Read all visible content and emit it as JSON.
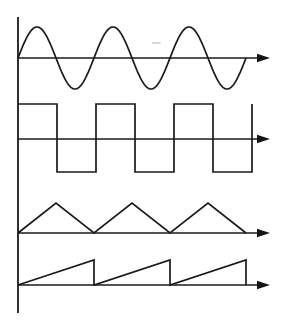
{
  "figure": {
    "background_color": "#ffffff",
    "line_color": "#1a1a1a",
    "width": 284,
    "height": 329
  },
  "vertical_axis": {
    "name": "shared-vertical-axis",
    "x": 18,
    "y_top": 17,
    "y_bottom": 313
  },
  "waveforms": [
    {
      "id": "sine",
      "label": "Sine wave",
      "shape": "sine",
      "axis_y": 58,
      "amplitude": 31,
      "period": 76,
      "x_start": 18,
      "x_end": 248,
      "cycles": 3,
      "phase": "rising-from-zero",
      "arrow_tip_x": 270
    },
    {
      "id": "square",
      "label": "Square wave",
      "shape": "square",
      "axis_y": 139,
      "top_y": 104,
      "bottom_y": 172,
      "period": 78,
      "x_start": 18,
      "x_end": 246,
      "cycles": 3,
      "phase": "starts-high",
      "duty_cycle": 50,
      "arrow_tip_x": 270
    },
    {
      "id": "triangle",
      "label": "Triangle wave",
      "shape": "triangle",
      "axis_y": 233,
      "peak_y": 203,
      "amplitude": 30,
      "period": 76,
      "x_start": 18,
      "x_end": 245,
      "cycles": 3,
      "phase": "rising-from-zero",
      "arrow_tip_x": 270
    },
    {
      "id": "sawtooth",
      "label": "Sawtooth wave",
      "shape": "sawtooth",
      "axis_y": 285,
      "peak_y": 260,
      "amplitude": 25,
      "period": 76,
      "x_start": 18,
      "x_end": 246,
      "cycles": 3,
      "phase": "ramp-up-reset",
      "arrow_tip_x": 270
    }
  ],
  "chart_data": {
    "type": "line",
    "subtitle": "",
    "xlabel": "",
    "ylabel": "",
    "grid": false,
    "legend": "none",
    "axis_ranges": {
      "x": [
        0,
        3
      ],
      "y": [
        -1,
        1
      ]
    },
    "series": [
      {
        "name": "Sine wave",
        "waveform": "sine",
        "cycles": 3,
        "amplitude": 1,
        "offset": 0,
        "duty_cycle": null,
        "x": [
          0,
          0.125,
          0.25,
          0.375,
          0.5,
          0.625,
          0.75,
          0.875,
          1,
          1.25,
          1.5,
          1.75,
          2,
          2.25,
          2.5,
          2.75,
          3
        ],
        "values": [
          0,
          0.707,
          1,
          0.707,
          0,
          -0.707,
          -1,
          -0.707,
          0,
          1,
          0,
          -1,
          0,
          1,
          0,
          -1,
          0
        ]
      },
      {
        "name": "Square wave",
        "waveform": "square",
        "cycles": 3,
        "amplitude": 1,
        "offset": 0,
        "duty_cycle": 50,
        "x": [
          0,
          0.5,
          0.5,
          1,
          1,
          1.5,
          1.5,
          2,
          2,
          2.5,
          2.5,
          3,
          3
        ],
        "values": [
          1,
          1,
          -1,
          -1,
          1,
          1,
          -1,
          -1,
          1,
          1,
          -1,
          -1,
          1
        ]
      },
      {
        "name": "Triangle wave",
        "waveform": "triangle",
        "cycles": 3,
        "amplitude": 1,
        "offset": 0,
        "duty_cycle": null,
        "x": [
          0,
          0.5,
          1,
          1.5,
          2,
          2.5,
          3
        ],
        "values": [
          0,
          1,
          0,
          1,
          0,
          1,
          0
        ]
      },
      {
        "name": "Sawtooth wave",
        "waveform": "sawtooth",
        "cycles": 3,
        "amplitude": 1,
        "offset": 0,
        "duty_cycle": null,
        "x": [
          0,
          1,
          1,
          2,
          2,
          3,
          3
        ],
        "values": [
          0,
          1,
          0,
          1,
          0,
          1,
          0
        ]
      }
    ]
  }
}
